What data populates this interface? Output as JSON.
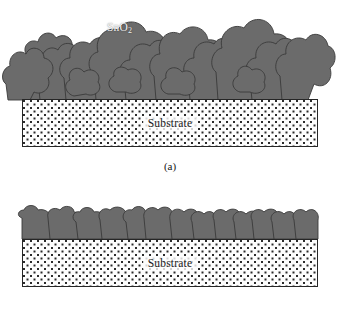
{
  "figure": {
    "type": "schematic-diagram",
    "background_color": "#ffffff"
  },
  "colors": {
    "grain_fill": "#6b6b6b",
    "grain_outline": "#3a3a3a",
    "substrate_dot": "#2b2b2b",
    "substrate_background": "#fdfdfd",
    "substrate_border": "#262626",
    "label_light": "#f2f2f2",
    "text": "#161616"
  },
  "panels": [
    {
      "id": "a",
      "caption": "(a)",
      "film_label": "SnO",
      "film_label_subscript": "2",
      "substrate_label": "Substrate",
      "morphology": "porous agglomerated irregular grains with large voids",
      "film_thickness_px": 95
    },
    {
      "id": "b",
      "caption": "(b)",
      "substrate_label": "Substrate",
      "morphology": "dense compact columnar grains",
      "film_thickness_px": 30
    }
  ]
}
